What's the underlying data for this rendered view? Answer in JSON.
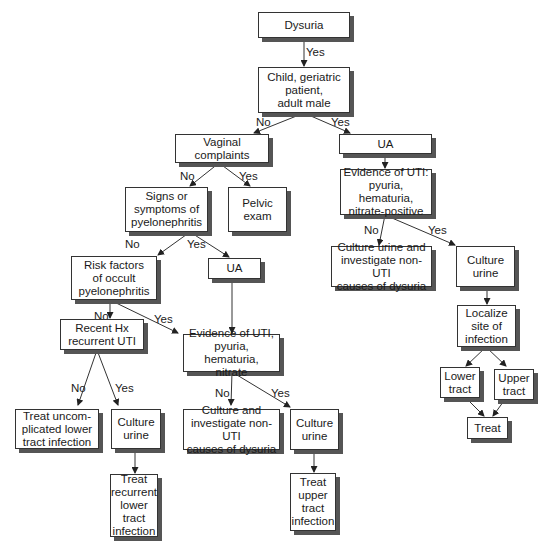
{
  "nodes": {
    "dysuria": "Dysuria",
    "child": "Child, geriatric\npatient,\nadult male",
    "vaginal": "Vaginal\ncomplaints",
    "ua_right": "UA",
    "pelvic": "Pelvic\nexam",
    "signs": "Signs or\nsymptoms of\npyelonephritis",
    "evidence_right": "Evidence of UTI:\npyuria, hematuria,\nnitrate-positive",
    "culture_investigate_right": "Culture urine and\ninvestigate non-UTI\ncauses of dysuria",
    "culture_right": "Culture\nurine",
    "risk": "Risk factors\nof occult\npyelonephritis",
    "ua_mid": "UA",
    "localize": "Localize\nsite of\ninfection",
    "recent": "Recent Hx\nrecurrent UTI",
    "evidence_mid": "Evidence of UTI,\npyuria, hematuria,\nnitrate",
    "lower_tract": "Lower\ntract",
    "upper_tract": "Upper\ntract",
    "treat_uncomplicated": "Treat uncom-\nplicated lower\ntract infection",
    "culture_left": "Culture\nurine",
    "culture_investigate_mid": "Culture and\ninvestigate non-UTI\ncauses of dysuria",
    "culture_mid": "Culture\nurine",
    "treat_right": "Treat",
    "treat_recurrent": "Treat\nrecurrent\nlower\ntract\ninfection",
    "treat_upper": "Treat\nupper\ntract\ninfection"
  },
  "edge_labels": {
    "yes": "Yes",
    "no": "No"
  }
}
